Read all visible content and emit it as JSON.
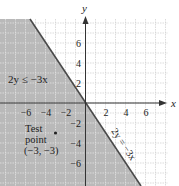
{
  "chart_data": {
    "type": "area",
    "title": "",
    "xlabel": "x",
    "ylabel": "y",
    "xlim": [
      -8.6,
      8.2
    ],
    "ylim": [
      -8.3,
      8.4
    ],
    "grid": true,
    "x_ticks": [
      -6,
      -4,
      -2,
      2,
      4,
      6
    ],
    "y_ticks": [
      6,
      4,
      2,
      -2,
      -4,
      -6
    ],
    "x_tick_labels": [
      "−6",
      "−4",
      "−2",
      "2",
      "4",
      "6"
    ],
    "y_tick_labels": [
      "6",
      "4",
      "2",
      "−2",
      "−4",
      "−6"
    ],
    "boundary_line": {
      "equation": "2y = -3x",
      "label": "2y = −3x",
      "slope": -1.5,
      "intercept": 0,
      "style": "solid"
    },
    "shaded_region": {
      "inequality": "2y ≤ -3x",
      "label": "2y ≤ −3x",
      "side": "below-left of line",
      "color": "#b9b9b9"
    },
    "test_point": {
      "x": -3,
      "y": -3,
      "label_line1": "Test",
      "label_line2": "point",
      "label_line3": "(−3, −3)"
    }
  },
  "colors": {
    "shade": "#b9b9b9",
    "grid_light": "#d6d6d6",
    "grid_on_shade": "#e8e8e8",
    "axis": "#333333",
    "line": "#4a4a4a"
  }
}
